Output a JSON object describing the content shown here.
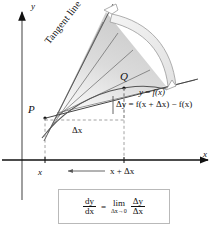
{
  "figure": {
    "type": "calculus-derivative-diagram",
    "background_color": "#ffffff",
    "ink_color": "#111111",
    "shade_color": "#d6d6d6",
    "box_border_color": "#b9b9b9"
  },
  "axes": {
    "y_label": "y",
    "x_label": "x"
  },
  "points": {
    "p_label": "P",
    "q_label": "Q"
  },
  "labels": {
    "tangent_line": "Tangent line",
    "curve_equation_y": "y",
    "curve_equation_eq": "=",
    "curve_equation_f": "f",
    "curve_equation_arg": "(x)",
    "delta_y_full": "Δy = f(x + Δx) − f(x)",
    "delta_x": "Δx",
    "x_tick": "x",
    "x_plus_delta_x": "x + Δx"
  },
  "formula": {
    "lhs_num": "dy",
    "lhs_den": "dx",
    "equals": "=",
    "lim_word": "lim",
    "lim_subscript": "Δx→0",
    "rhs_num": "Δy",
    "rhs_den": "Δx"
  }
}
